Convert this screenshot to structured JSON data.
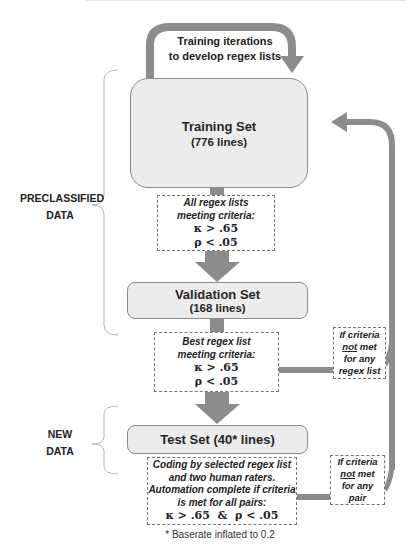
{
  "diagram": {
    "loop_label": {
      "line1": "Training iterations",
      "line2": "to develop regex lists"
    },
    "side_labels": {
      "preclassified": {
        "line1": "PRECLASSIFIED",
        "line2": "DATA"
      },
      "new_data": {
        "line1": "NEW",
        "line2": "DATA"
      }
    },
    "training_set": {
      "title": "Training Set",
      "subtitle": "(776 lines)"
    },
    "criteria_1": {
      "line1": "All regex lists",
      "line2": "meeting criteria:",
      "kappa": "κ > .65",
      "rho": "ρ < .05"
    },
    "validation_set": {
      "title": "Validation Set",
      "subtitle": "(168 lines)"
    },
    "criteria_2": {
      "line1": "Best regex list",
      "line2": "meeting criteria:",
      "kappa": "κ > .65",
      "rho": "ρ < .05"
    },
    "test_set": {
      "title": "Test Set (40* lines)"
    },
    "criteria_3": {
      "line1": "Coding by selected regex list",
      "line2": "and two human raters.",
      "line3": "Automation complete if criteria",
      "line4": "is met for all pairs:",
      "math": "κ > .65  &  ρ < .05"
    },
    "fail_regex": {
      "line1": "If criteria",
      "not": "not",
      "met": " met",
      "line3": "for any",
      "line4": "regex list"
    },
    "fail_pair": {
      "line1": "If criteria",
      "not": "not",
      "met": " met",
      "line3": "for any",
      "line4": "pair"
    },
    "footnote": "* Baserate inflated to 0.2",
    "colors": {
      "arrow": "#8c8c8c",
      "box_fill": "#ececec",
      "box_border": "#8a8a8a",
      "brace": "#b5b5b5"
    }
  }
}
